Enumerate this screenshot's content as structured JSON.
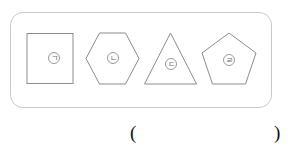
{
  "figure": {
    "panel_label": "shape group panel",
    "border_color": "#c9c9c9",
    "shape_stroke_color": "#8c8c8c",
    "shapes": [
      {
        "name": "square",
        "sides": 4,
        "marker": "㈠",
        "marker_text": "ㄱ"
      },
      {
        "name": "hexagon",
        "sides": 6,
        "marker": "㈡",
        "marker_text": "ㄴ"
      },
      {
        "name": "triangle",
        "sides": 3,
        "marker": "㈢",
        "marker_text": "ㄷ"
      },
      {
        "name": "pentagon",
        "sides": 5,
        "marker": "㈣",
        "marker_text": "ㄹ"
      }
    ]
  },
  "answer": {
    "open_paren": "(",
    "close_paren": ")",
    "value": ""
  }
}
